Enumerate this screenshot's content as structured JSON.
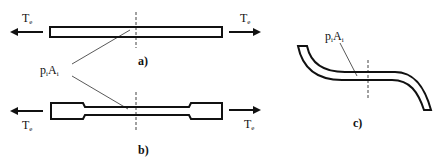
{
  "figure": {
    "panels": [
      {
        "id": "a",
        "label": "a)",
        "shape": "straight-bar",
        "force_left": {
          "symbol": "T",
          "subscript": "e"
        },
        "force_right": {
          "symbol": "T",
          "subscript": "e"
        }
      },
      {
        "id": "b",
        "label": "b)",
        "shape": "dogbone-specimen",
        "force_left": {
          "symbol": "T",
          "subscript": "e"
        },
        "force_right": {
          "symbol": "T",
          "subscript": "e"
        }
      },
      {
        "id": "c",
        "label": "c)",
        "shape": "s-curved-bar"
      }
    ],
    "annotations": {
      "shared_callout": {
        "p": "p",
        "p_sub": "i",
        "A": "A",
        "A_sub": "i"
      },
      "c_callout": {
        "p": "p",
        "p_sub": "i",
        "A": "A",
        "A_sub": "i"
      }
    },
    "colors": {
      "stroke": "#111111",
      "background": "#ffffff"
    }
  }
}
